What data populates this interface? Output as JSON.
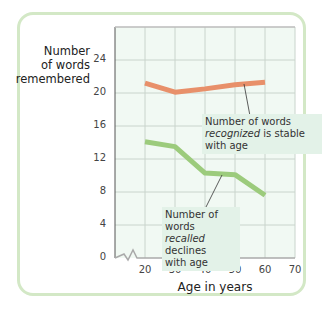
{
  "chart_data": {
    "type": "line",
    "title": "",
    "xlabel": "Age in years",
    "ylabel": "Number of words remembered",
    "x": [
      20,
      30,
      40,
      50,
      60
    ],
    "x_ticks": [
      "20",
      "30",
      "40",
      "50",
      "60",
      "70"
    ],
    "y_ticks": [
      "0",
      "4",
      "8",
      "12",
      "16",
      "20",
      "24"
    ],
    "xlim": [
      20,
      70
    ],
    "ylim": [
      0,
      27
    ],
    "grid": true,
    "axis_break": "y-axis break between 0 and 20 on x-axis",
    "series": [
      {
        "name": "Recognized",
        "color": "#e8906a",
        "values": [
          21.2,
          20.1,
          20.5,
          21.0,
          21.3
        ]
      },
      {
        "name": "Recalled",
        "color": "#9ccb7c",
        "values": [
          14.1,
          13.5,
          10.3,
          10.1,
          7.6
        ]
      }
    ],
    "annotations": [
      {
        "pre": "Number of words",
        "em": "recognized",
        "post": " is stable",
        "last": "with age"
      },
      {
        "pre": "Number of words",
        "em": "recalled",
        "post": " declines",
        "last": "with age"
      }
    ]
  },
  "labels": {
    "ylabel_1": "Number",
    "ylabel_2": "of words",
    "ylabel_3": "remembered",
    "xlabel": "Age in years"
  }
}
